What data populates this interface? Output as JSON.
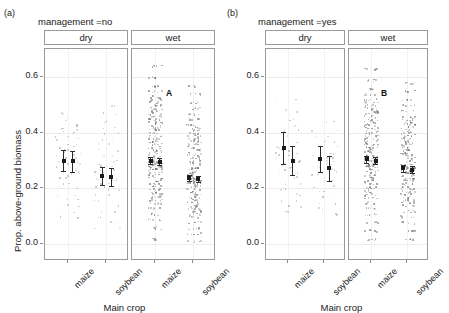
{
  "figure": {
    "panel_a_tag": "(a)",
    "panel_b_tag": "(b)",
    "axis": {
      "ylabel": "Prop. above-ground biomass",
      "xlabel": "Main crop",
      "yticks": [
        "0.6",
        "0.4",
        "0.2",
        "0.0"
      ],
      "ytick_values": [
        0.6,
        0.4,
        0.2,
        0.0
      ],
      "ylim": [
        -0.06,
        0.7
      ],
      "xticks": [
        "maize",
        "soybean"
      ]
    }
  },
  "panels": [
    {
      "key": "a",
      "tag": "(a)",
      "title": "management =no",
      "facets": [
        {
          "key": "dry",
          "label": "dry",
          "letter": ""
        },
        {
          "key": "wet",
          "label": "wet",
          "letter": "A"
        }
      ]
    },
    {
      "key": "b",
      "tag": "(b)",
      "title": "management =yes",
      "facets": [
        {
          "key": "dry",
          "label": "dry",
          "letter": ""
        },
        {
          "key": "wet",
          "label": "wet",
          "letter": "B"
        }
      ]
    }
  ],
  "chart_data": {
    "type": "scatter",
    "title": "",
    "xlabel": "Main crop",
    "ylabel": "Prop. above-ground biomass",
    "ylim": [
      -0.06,
      0.7
    ],
    "yticks": [
      0.0,
      0.2,
      0.4,
      0.6
    ],
    "categories": [
      "maize",
      "soybean"
    ],
    "grid": true,
    "legend": false,
    "facet_rows": [
      "management =no",
      "management =yes"
    ],
    "facet_cols": [
      "dry",
      "wet"
    ],
    "annotations": [
      {
        "panel": "a",
        "facet": "wet",
        "text": "A",
        "x": 0.42,
        "y": 0.56
      },
      {
        "panel": "b",
        "facet": "wet",
        "text": "B",
        "x": 0.42,
        "y": 0.56
      }
    ],
    "groups": [
      {
        "panel": "a",
        "facet": "dry",
        "crop": "maize",
        "estimates": [
          {
            "sub": 1,
            "mean": 0.3,
            "lower": 0.262,
            "upper": 0.338
          },
          {
            "sub": 2,
            "mean": 0.297,
            "lower": 0.258,
            "upper": 0.336
          }
        ],
        "point_cloud_density": "sparse",
        "points": [
          0.47,
          0.45,
          0.43,
          0.42,
          0.41,
          0.4,
          0.39,
          0.38,
          0.36,
          0.35,
          0.34,
          0.33,
          0.32,
          0.31,
          0.3,
          0.3,
          0.29,
          0.28,
          0.27,
          0.26,
          0.25,
          0.24,
          0.22,
          0.2,
          0.18,
          0.16,
          0.14,
          0.12,
          0.1
        ]
      },
      {
        "panel": "a",
        "facet": "dry",
        "crop": "soybean",
        "estimates": [
          {
            "sub": 1,
            "mean": 0.243,
            "lower": 0.212,
            "upper": 0.276
          },
          {
            "sub": 2,
            "mean": 0.241,
            "lower": 0.208,
            "upper": 0.274
          }
        ],
        "point_cloud_density": "sparse",
        "points": [
          0.5,
          0.47,
          0.44,
          0.42,
          0.4,
          0.38,
          0.36,
          0.34,
          0.32,
          0.3,
          0.29,
          0.28,
          0.27,
          0.26,
          0.25,
          0.24,
          0.23,
          0.22,
          0.21,
          0.2,
          0.18,
          0.16,
          0.14,
          0.12,
          0.1,
          0.08,
          0.06
        ]
      },
      {
        "panel": "a",
        "facet": "wet",
        "crop": "maize",
        "estimates": [
          {
            "sub": 1,
            "mean": 0.3,
            "lower": 0.287,
            "upper": 0.313
          },
          {
            "sub": 2,
            "mean": 0.296,
            "lower": 0.283,
            "upper": 0.309
          }
        ],
        "point_cloud_density": "dense",
        "points": [
          0.64,
          0.6,
          0.57,
          0.55,
          0.53,
          0.52,
          0.51,
          0.5,
          0.49,
          0.48,
          0.47,
          0.46,
          0.45,
          0.44,
          0.43,
          0.42,
          0.41,
          0.4,
          0.39,
          0.38,
          0.37,
          0.36,
          0.35,
          0.34,
          0.33,
          0.32,
          0.31,
          0.3,
          0.3,
          0.29,
          0.29,
          0.28,
          0.28,
          0.27,
          0.27,
          0.26,
          0.25,
          0.24,
          0.23,
          0.22,
          0.21,
          0.2,
          0.19,
          0.18,
          0.17,
          0.16,
          0.15,
          0.13,
          0.11,
          0.09,
          0.06,
          0.02
        ]
      },
      {
        "panel": "a",
        "facet": "wet",
        "crop": "soybean",
        "estimates": [
          {
            "sub": 1,
            "mean": 0.238,
            "lower": 0.226,
            "upper": 0.25
          },
          {
            "sub": 2,
            "mean": 0.234,
            "lower": 0.222,
            "upper": 0.246
          }
        ],
        "point_cloud_density": "dense",
        "points": [
          0.57,
          0.54,
          0.51,
          0.49,
          0.47,
          0.45,
          0.43,
          0.42,
          0.41,
          0.4,
          0.39,
          0.38,
          0.37,
          0.36,
          0.35,
          0.34,
          0.33,
          0.32,
          0.31,
          0.3,
          0.29,
          0.28,
          0.27,
          0.26,
          0.25,
          0.24,
          0.24,
          0.23,
          0.23,
          0.22,
          0.22,
          0.21,
          0.2,
          0.19,
          0.18,
          0.17,
          0.16,
          0.15,
          0.14,
          0.13,
          0.12,
          0.11,
          0.1,
          0.08,
          0.06,
          0.04,
          0.01
        ]
      },
      {
        "panel": "b",
        "facet": "dry",
        "crop": "maize",
        "estimates": [
          {
            "sub": 1,
            "mean": 0.345,
            "lower": 0.288,
            "upper": 0.402
          },
          {
            "sub": 2,
            "mean": 0.3,
            "lower": 0.248,
            "upper": 0.352
          }
        ],
        "point_cloud_density": "sparse",
        "points": [
          0.52,
          0.48,
          0.45,
          0.43,
          0.41,
          0.39,
          0.37,
          0.35,
          0.34,
          0.33,
          0.32,
          0.31,
          0.3,
          0.29,
          0.28,
          0.27,
          0.26,
          0.24,
          0.22,
          0.2,
          0.18,
          0.16,
          0.14,
          0.12
        ]
      },
      {
        "panel": "b",
        "facet": "dry",
        "crop": "soybean",
        "estimates": [
          {
            "sub": 1,
            "mean": 0.305,
            "lower": 0.258,
            "upper": 0.352
          },
          {
            "sub": 2,
            "mean": 0.272,
            "lower": 0.228,
            "upper": 0.316
          }
        ],
        "point_cloud_density": "sparse",
        "points": [
          0.44,
          0.41,
          0.39,
          0.37,
          0.35,
          0.33,
          0.32,
          0.31,
          0.3,
          0.29,
          0.28,
          0.27,
          0.26,
          0.25,
          0.23,
          0.21,
          0.19,
          0.17,
          0.15,
          0.13,
          0.11
        ]
      },
      {
        "panel": "b",
        "facet": "wet",
        "crop": "maize",
        "estimates": [
          {
            "sub": 1,
            "mean": 0.305,
            "lower": 0.292,
            "upper": 0.318
          },
          {
            "sub": 2,
            "mean": 0.3,
            "lower": 0.287,
            "upper": 0.313
          }
        ],
        "point_cloud_density": "dense",
        "points": [
          0.63,
          0.59,
          0.56,
          0.54,
          0.52,
          0.51,
          0.5,
          0.49,
          0.48,
          0.47,
          0.46,
          0.45,
          0.44,
          0.43,
          0.42,
          0.41,
          0.4,
          0.39,
          0.38,
          0.37,
          0.36,
          0.35,
          0.34,
          0.33,
          0.32,
          0.31,
          0.31,
          0.3,
          0.3,
          0.29,
          0.29,
          0.28,
          0.28,
          0.27,
          0.26,
          0.25,
          0.24,
          0.23,
          0.22,
          0.21,
          0.2,
          0.19,
          0.18,
          0.17,
          0.15,
          0.13,
          0.11,
          0.08,
          0.05,
          0.02
        ]
      },
      {
        "panel": "b",
        "facet": "wet",
        "crop": "soybean",
        "estimates": [
          {
            "sub": 1,
            "mean": 0.272,
            "lower": 0.259,
            "upper": 0.285
          },
          {
            "sub": 2,
            "mean": 0.268,
            "lower": 0.255,
            "upper": 0.281
          }
        ],
        "point_cloud_density": "dense",
        "points": [
          0.58,
          0.55,
          0.52,
          0.5,
          0.48,
          0.46,
          0.45,
          0.44,
          0.43,
          0.42,
          0.41,
          0.4,
          0.39,
          0.38,
          0.37,
          0.36,
          0.35,
          0.34,
          0.33,
          0.32,
          0.31,
          0.3,
          0.29,
          0.28,
          0.28,
          0.27,
          0.27,
          0.26,
          0.26,
          0.25,
          0.24,
          0.23,
          0.22,
          0.21,
          0.2,
          0.19,
          0.18,
          0.17,
          0.16,
          0.15,
          0.14,
          0.12,
          0.1,
          0.08,
          0.05,
          0.02
        ]
      }
    ]
  }
}
